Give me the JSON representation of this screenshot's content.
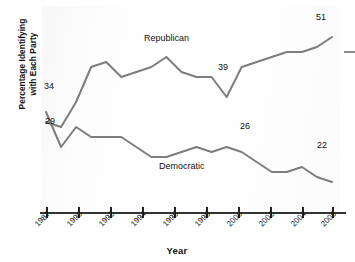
{
  "chart_data": {
    "type": "line",
    "title": "",
    "subtitle": "",
    "xlabel": "Year",
    "ylabel": "Percentage Identifying with Each Party",
    "grid": false,
    "legend_position": "inline-series-labels",
    "xlim": [
      1987,
      2006
    ],
    "ylim": [
      18,
      54
    ],
    "tick_labels": [
      "1987",
      "1990",
      "1992",
      "1994",
      "1996",
      "1998",
      "2000",
      "2002",
      "2004",
      "2006"
    ],
    "tick_values": [
      1987,
      1990,
      1992,
      1994,
      1996,
      1998,
      2000,
      2002,
      2004,
      2006
    ],
    "x": [
      1987,
      1988,
      1989,
      1990,
      1991,
      1992,
      1993,
      1994,
      1995,
      1996,
      1997,
      1998,
      1999,
      2000,
      2001,
      2002,
      2003,
      2004,
      2005,
      2006
    ],
    "series": [
      {
        "name": "Republican",
        "color": "#7d7d7d",
        "values": [
          34,
          33,
          38,
          45,
          46,
          43,
          44,
          45,
          47,
          44,
          43,
          43,
          39,
          45,
          46,
          47,
          48,
          48,
          49,
          51
        ]
      },
      {
        "name": "Democratic",
        "color": "#7d7d7d",
        "values": [
          36,
          29,
          33,
          31,
          31,
          31,
          29,
          27,
          27,
          28,
          29,
          28,
          29,
          28,
          26,
          24,
          24,
          25,
          23,
          22
        ]
      }
    ],
    "annotations": [
      {
        "text": "34",
        "series": "Republican",
        "x": 1987,
        "value": 34
      },
      {
        "text": "29",
        "series": "Democratic",
        "x": 1988,
        "value": 29
      },
      {
        "text": "39",
        "series": "Republican",
        "x": 1999,
        "value": 39
      },
      {
        "text": "51",
        "series": "Republican",
        "x": 2006,
        "value": 51
      },
      {
        "text": "26",
        "series": "Democratic",
        "x": 2001,
        "value": 26
      },
      {
        "text": "22",
        "series": "Democratic",
        "x": 2006,
        "value": 22
      }
    ],
    "series_inline_labels": [
      {
        "text": "Republican"
      },
      {
        "text": "Democratic"
      }
    ]
  },
  "axes": {
    "y_title_line1": "Percentage Identifying",
    "y_title_line2": "with Each Party",
    "x_title": "Year"
  },
  "labels": {
    "republican": "Republican",
    "democratic": "Democratic",
    "v34": "34",
    "v29": "29",
    "v39": "39",
    "v51": "51",
    "v26": "26",
    "v22": "22"
  },
  "ticks": {
    "t0": "1987",
    "t1": "1990",
    "t2": "1992",
    "t3": "1994",
    "t4": "1996",
    "t5": "1998",
    "t6": "2000",
    "t7": "2002",
    "t8": "2004",
    "t9": "2006"
  },
  "colors": {
    "line": "#7d7d7d",
    "axis": "#333333",
    "text": "#111111"
  }
}
